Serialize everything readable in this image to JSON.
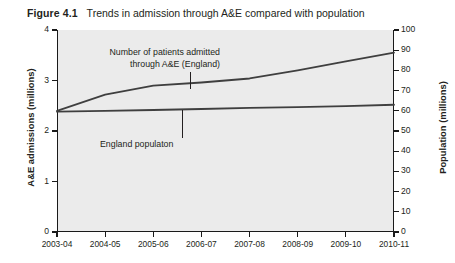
{
  "figure": {
    "number": "Figure 4.1",
    "caption": "Trends in admission through A&E compared with population"
  },
  "chart_data": {
    "type": "line",
    "title": "Trends in admission through A&E compared with population",
    "xlabel": "",
    "ylabel": "A&E admissions (millions)",
    "y2label": "Population (millions)",
    "grid": false,
    "legend": "none (direct annotations)",
    "categories": [
      "2003-04",
      "2004-05",
      "2005-06",
      "2006-07",
      "2007-08",
      "2008-09",
      "2009-10",
      "2010-11"
    ],
    "ylim": [
      0,
      4
    ],
    "yticks": [
      "0",
      "1",
      "2",
      "3",
      "4"
    ],
    "y2lim": [
      0,
      100
    ],
    "y2ticks": [
      "0",
      "10",
      "20",
      "30",
      "40",
      "50",
      "60",
      "70",
      "80",
      "90",
      "100"
    ],
    "series": [
      {
        "name": "Number of patients admitted through A&E (England)",
        "axis": "left",
        "units": "millions",
        "color": "#3f3f3f",
        "values": [
          2.4,
          2.72,
          2.9,
          2.96,
          3.04,
          3.2,
          3.38,
          3.55
        ]
      },
      {
        "name": "England populaton",
        "axis": "right",
        "units": "millions",
        "color": "#3f3f3f",
        "values": [
          59.6,
          60.0,
          60.4,
          60.9,
          61.4,
          61.8,
          62.3,
          63.0
        ]
      }
    ],
    "annotations": [
      {
        "id": "admissions",
        "line1": "Number of patients admitted",
        "line2": "through A&E (England)",
        "points_to_category": "2006-07"
      },
      {
        "id": "population",
        "text": "England populaton",
        "points_to_category": "2006-07"
      }
    ]
  },
  "axes": {
    "left": {
      "title": "A&E admissions (millions)",
      "ticks": [
        "4",
        "3",
        "2",
        "1",
        "0"
      ]
    },
    "right": {
      "title": "Population (millions)",
      "ticks": [
        "100",
        "90",
        "80",
        "70",
        "60",
        "50",
        "40",
        "30",
        "20",
        "10",
        "0"
      ]
    },
    "bottom": {
      "ticks": [
        "2003-04",
        "2004-05",
        "2005-06",
        "2006-07",
        "2007-08",
        "2008-09",
        "2009-10",
        "2010-11"
      ]
    }
  },
  "style": {
    "plot_background": "#ebebeb",
    "axis_color": "#1a1a1a",
    "series_color": "#3f3f3f",
    "text_color": "#231f20"
  }
}
